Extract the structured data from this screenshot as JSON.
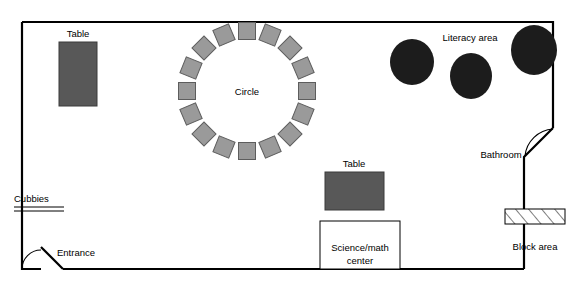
{
  "canvas": {
    "width": 575,
    "height": 289
  },
  "labels": {
    "table_left": "Table",
    "table_center": "Table",
    "circle": "Circle",
    "literacy_area": "Literacy area",
    "bathroom": "Bathroom",
    "block_area": "Block area",
    "cubbies": "Cubbies",
    "entrance": "Entrance",
    "science_math_center": "Science/math center",
    "science_math_center_line1": "Science/math",
    "science_math_center_line2": "center"
  },
  "colors": {
    "wall": "#000000",
    "chair_fill": "#9a9a9a",
    "chair_stroke": "#5d5d5d",
    "table_fill": "#585858",
    "table_stroke": "#3a3a3a",
    "blob_fill": "#1c1c1c",
    "background": "#ffffff"
  },
  "room": {
    "outline_points": "22,22 553,22 553,128 524,157 524,269 63,269 41,247 41,269 22,269 22,22"
  },
  "furniture": {
    "tables": [
      {
        "name": "table-left",
        "x": 59,
        "y": 42,
        "width": 38,
        "height": 64,
        "label": "Table",
        "label_x": 78,
        "label_y": 34
      },
      {
        "name": "table-center",
        "x": 325,
        "y": 172,
        "width": 59,
        "height": 38,
        "label": "Table",
        "label_x": 354,
        "label_y": 164
      }
    ],
    "circle_meeting": {
      "label": "Circle",
      "center_x": 247,
      "center_y": 91,
      "ring_radius": 60,
      "chair_size": 17,
      "chair_count": 16,
      "chairs": [
        {
          "cx": 247,
          "cy": 31,
          "rot": 0
        },
        {
          "cx": 270,
          "cy": 35,
          "rot": 22
        },
        {
          "cx": 290,
          "cy": 48,
          "rot": 45
        },
        {
          "cx": 303,
          "cy": 68,
          "rot": 67
        },
        {
          "cx": 307,
          "cy": 91,
          "rot": 90
        },
        {
          "cx": 303,
          "cy": 114,
          "rot": 112
        },
        {
          "cx": 290,
          "cy": 134,
          "rot": 135
        },
        {
          "cx": 270,
          "cy": 147,
          "rot": 157
        },
        {
          "cx": 247,
          "cy": 151,
          "rot": 180
        },
        {
          "cx": 224,
          "cy": 147,
          "rot": 202
        },
        {
          "cx": 204,
          "cy": 134,
          "rot": 225
        },
        {
          "cx": 191,
          "cy": 114,
          "rot": 247
        },
        {
          "cx": 187,
          "cy": 91,
          "rot": 270
        },
        {
          "cx": 191,
          "cy": 68,
          "rot": 292
        },
        {
          "cx": 204,
          "cy": 48,
          "rot": 315
        },
        {
          "cx": 224,
          "cy": 35,
          "rot": 337
        }
      ]
    },
    "literacy_blobs": [
      {
        "name": "literacy-blob-left",
        "cx": 412,
        "cy": 62,
        "rx": 22,
        "ry": 23
      },
      {
        "name": "literacy-blob-middle",
        "cx": 471,
        "cy": 76,
        "rx": 21,
        "ry": 23
      },
      {
        "name": "literacy-blob-right",
        "cx": 534,
        "cy": 50,
        "rx": 23,
        "ry": 25
      }
    ],
    "cubbies": {
      "x1": 14,
      "y1": 210,
      "x2": 64,
      "y2": 210,
      "gap": 4,
      "label_x": 14,
      "label_y": 199
    },
    "block_area_shelf": {
      "x": 505,
      "y": 209,
      "width": 60,
      "height": 15,
      "label_x": 505,
      "label_y": 247
    },
    "science_math_box": {
      "x": 320,
      "y": 221,
      "width": 80,
      "height": 48
    },
    "entrance_door": {
      "hinge_x": 41,
      "hinge_y": 269,
      "arc_radius": 24,
      "leaf_x": 63,
      "leaf_y": 269,
      "label_x": 57,
      "label_y": 253
    },
    "bathroom_door": {
      "arc_start_x": 553,
      "arc_start_y": 128,
      "arc_end_x": 524,
      "arc_end_y": 157,
      "label_x": 501,
      "label_y": 155
    }
  }
}
